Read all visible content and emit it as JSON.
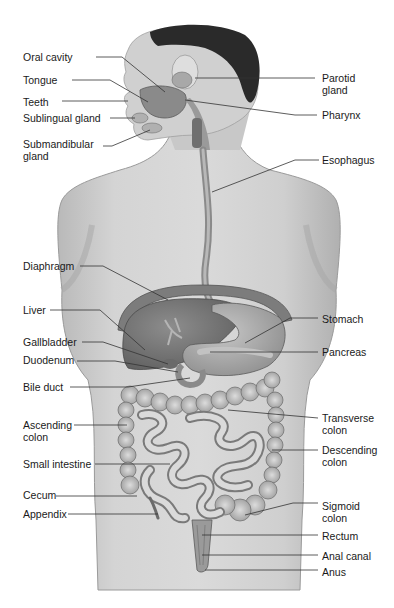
{
  "diagram": {
    "labels_left": [
      {
        "id": "oral-cavity",
        "text": "Oral cavity",
        "x": 23,
        "y": 51,
        "line": [
          [
            96,
            57
          ],
          [
            122,
            57
          ],
          [
            165,
            92
          ]
        ]
      },
      {
        "id": "tongue",
        "text": "Tongue",
        "x": 23,
        "y": 74,
        "line": [
          [
            72,
            80
          ],
          [
            110,
            80
          ],
          [
            148,
            102
          ]
        ]
      },
      {
        "id": "teeth",
        "text": "Teeth",
        "x": 23,
        "y": 96,
        "line": [
          [
            62,
            101
          ],
          [
            128,
            101
          ]
        ]
      },
      {
        "id": "sublingual-gland",
        "text": "Sublingual gland",
        "x": 23,
        "y": 112,
        "line": [
          [
            110,
            118
          ],
          [
            135,
            118
          ]
        ]
      },
      {
        "id": "submandibular-gland",
        "text": "Submandibular\ngland",
        "x": 23,
        "y": 138,
        "line": [
          [
            103,
            146
          ],
          [
            112,
            146
          ],
          [
            150,
            130
          ]
        ]
      },
      {
        "id": "diaphragm",
        "text": "Diaphragm",
        "x": 23,
        "y": 260,
        "line": [
          [
            80,
            266
          ],
          [
            103,
            266
          ],
          [
            168,
            300
          ]
        ]
      },
      {
        "id": "liver",
        "text": "Liver",
        "x": 23,
        "y": 304,
        "line": [
          [
            50,
            310
          ],
          [
            100,
            310
          ],
          [
            145,
            350
          ]
        ]
      },
      {
        "id": "gallbladder",
        "text": "Gallbladder",
        "x": 23,
        "y": 336,
        "line": [
          [
            82,
            342
          ],
          [
            103,
            342
          ],
          [
            168,
            364
          ]
        ]
      },
      {
        "id": "duodenum",
        "text": "Duodenum",
        "x": 23,
        "y": 354,
        "line": [
          [
            77,
            361
          ],
          [
            115,
            361
          ],
          [
            178,
            372
          ]
        ]
      },
      {
        "id": "bile-duct",
        "text": "Bile duct",
        "x": 23,
        "y": 381,
        "line": [
          [
            70,
            387
          ],
          [
            128,
            387
          ],
          [
            190,
            378
          ]
        ]
      },
      {
        "id": "ascending-colon",
        "text": "Ascending\ncolon",
        "x": 23,
        "y": 419,
        "line": [
          [
            74,
            425
          ],
          [
            127,
            425
          ]
        ]
      },
      {
        "id": "small-intestine",
        "text": "Small intestine",
        "x": 23,
        "y": 458,
        "line": [
          [
            95,
            464
          ],
          [
            170,
            464
          ]
        ]
      },
      {
        "id": "cecum",
        "text": "Cecum",
        "x": 23,
        "y": 489,
        "line": [
          [
            56,
            496
          ],
          [
            137,
            496
          ]
        ]
      },
      {
        "id": "appendix",
        "text": "Appendix",
        "x": 23,
        "y": 508,
        "line": [
          [
            68,
            514
          ],
          [
            158,
            514
          ]
        ]
      }
    ],
    "labels_right": [
      {
        "id": "parotid-gland",
        "text": "Parotid\ngland",
        "x": 322,
        "y": 72,
        "line": [
          [
            315,
            78
          ],
          [
            195,
            78
          ]
        ]
      },
      {
        "id": "pharynx",
        "text": "Pharynx",
        "x": 322,
        "y": 109,
        "line": [
          [
            317,
            115
          ],
          [
            295,
            115
          ],
          [
            185,
            100
          ]
        ]
      },
      {
        "id": "esophagus",
        "text": "Esophagus",
        "x": 322,
        "y": 154,
        "line": [
          [
            319,
            160
          ],
          [
            295,
            160
          ],
          [
            212,
            192
          ]
        ]
      },
      {
        "id": "stomach",
        "text": "Stomach",
        "x": 322,
        "y": 313,
        "line": [
          [
            318,
            318
          ],
          [
            290,
            318
          ],
          [
            245,
            343
          ]
        ]
      },
      {
        "id": "pancreas",
        "text": "Pancreas",
        "x": 322,
        "y": 346,
        "line": [
          [
            318,
            352
          ],
          [
            210,
            352
          ]
        ]
      },
      {
        "id": "transverse-colon",
        "text": "Transverse\ncolon",
        "x": 322,
        "y": 412,
        "line": [
          [
            318,
            418
          ],
          [
            228,
            410
          ]
        ]
      },
      {
        "id": "descending-colon",
        "text": "Descending\ncolon",
        "x": 322,
        "y": 444,
        "line": [
          [
            318,
            450
          ],
          [
            272,
            450
          ]
        ]
      },
      {
        "id": "sigmoid-colon",
        "text": "Sigmoid\ncolon",
        "x": 322,
        "y": 500,
        "line": [
          [
            318,
            503
          ],
          [
            293,
            503
          ],
          [
            245,
            515
          ]
        ]
      },
      {
        "id": "rectum",
        "text": "Rectum",
        "x": 322,
        "y": 530,
        "line": [
          [
            318,
            535
          ],
          [
            202,
            535
          ]
        ]
      },
      {
        "id": "anal-canal",
        "text": "Anal canal",
        "x": 322,
        "y": 550,
        "line": [
          [
            318,
            555
          ],
          [
            202,
            555
          ]
        ]
      },
      {
        "id": "anus",
        "text": "Anus",
        "x": 322,
        "y": 566,
        "line": [
          [
            318,
            570
          ],
          [
            205,
            570
          ]
        ]
      }
    ],
    "colors": {
      "background": "#ffffff",
      "skin": "#cfcfcf",
      "skin_shadow": "#a8a8a8",
      "hair": "#2a2a2a",
      "organ_dark": "#7a7a7a",
      "organ_mid": "#9c9c9c",
      "organ_light": "#c4c4c4",
      "leader_line": "#333333",
      "text": "#1a1a1a"
    }
  }
}
